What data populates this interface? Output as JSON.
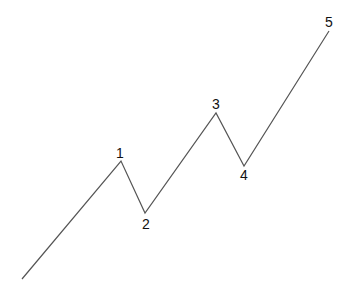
{
  "diagram": {
    "title": "",
    "line_color": "#555555",
    "label_color": "#111111",
    "start": {
      "x": 22,
      "y": 279
    },
    "points": [
      {
        "label": "1",
        "x": 121,
        "y": 161,
        "label_x": 120,
        "label_y": 153
      },
      {
        "label": "2",
        "x": 145,
        "y": 213,
        "label_x": 146,
        "label_y": 224
      },
      {
        "label": "3",
        "x": 216,
        "y": 113,
        "label_x": 216,
        "label_y": 104
      },
      {
        "label": "4",
        "x": 244,
        "y": 166,
        "label_x": 244,
        "label_y": 175
      },
      {
        "label": "5",
        "x": 329,
        "y": 31,
        "label_x": 329,
        "label_y": 22
      }
    ]
  }
}
